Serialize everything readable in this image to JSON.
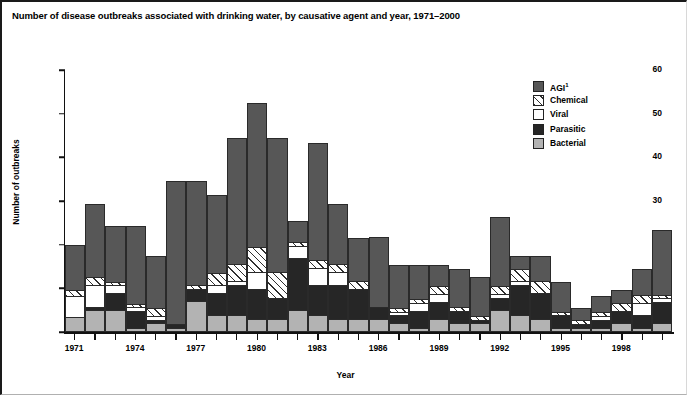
{
  "title": "Number of disease outbreaks associated with drinking water, by causative agent and year, 1971–2000",
  "axes": {
    "ylabel": "Number of outbreaks",
    "xlabel": "Year",
    "yticks": [
      "0",
      "10",
      "20",
      "30",
      "40",
      "50",
      "60"
    ],
    "xticklabels": [
      "1971",
      "1974",
      "1977",
      "1980",
      "1983",
      "1986",
      "1989",
      "1992",
      "1995",
      "1998"
    ]
  },
  "legend": {
    "title": "",
    "items": [
      {
        "label": "AGI",
        "sup": "1",
        "key": "agi",
        "color": "#575757",
        "swatch": "s-agi"
      },
      {
        "label": "Chemical",
        "sup": "",
        "key": "chemical",
        "color": "#ffffff",
        "swatch": "s-chem"
      },
      {
        "label": "Viral",
        "sup": "",
        "key": "viral",
        "color": "#ffffff",
        "swatch": "s-viral"
      },
      {
        "label": "Parasitic",
        "sup": "",
        "key": "parasitic",
        "color": "#262626",
        "swatch": "s-para"
      },
      {
        "label": "Bacterial",
        "sup": "",
        "key": "bacterial",
        "color": "#b3b3b3",
        "swatch": "s-bact"
      }
    ]
  },
  "chart_data": {
    "type": "bar",
    "stacked": true,
    "title": "Number of disease outbreaks associated with drinking water, by causative agent and year, 1971–2000",
    "xlabel": "Year",
    "ylabel": "Number of outbreaks",
    "ylim": [
      0,
      60
    ],
    "ytick_step": 10,
    "grid": false,
    "legend_position": "upper right",
    "stack_order_bottom_to_top": [
      "Bacterial",
      "Parasitic",
      "Viral",
      "Chemical",
      "AGI"
    ],
    "categories": [
      1971,
      1972,
      1973,
      1974,
      1975,
      1976,
      1977,
      1978,
      1979,
      1980,
      1981,
      1982,
      1983,
      1984,
      1985,
      1986,
      1987,
      1988,
      1989,
      1990,
      1991,
      1992,
      1993,
      1994,
      1995,
      1996,
      1997,
      1998,
      1999,
      2000
    ],
    "series": [
      {
        "name": "Bacterial",
        "values": [
          3.5,
          5,
          5,
          1,
          2,
          1,
          7,
          4,
          4,
          3,
          3,
          5,
          4,
          3,
          3,
          3,
          2,
          1,
          3,
          2,
          2,
          5,
          4,
          3,
          1,
          1,
          1,
          2,
          1,
          2
        ]
      },
      {
        "name": "Parasitic",
        "values": [
          0,
          1,
          4,
          4,
          1,
          1,
          3,
          5,
          7,
          7,
          5,
          12,
          7,
          8,
          7,
          3,
          2,
          4,
          4,
          3,
          1,
          3,
          7,
          6,
          3,
          1,
          2,
          3,
          3,
          5
        ]
      },
      {
        "name": "Viral",
        "values": [
          5,
          5,
          2,
          1,
          1,
          0,
          0,
          2,
          1,
          4,
          0,
          3,
          4,
          3,
          0,
          0,
          1,
          2,
          2,
          0,
          0,
          1,
          1,
          0,
          0,
          0,
          1,
          0,
          3,
          1
        ]
      },
      {
        "name": "Chemical",
        "values": [
          1.5,
          2,
          1,
          1,
          2,
          0,
          1,
          3,
          4,
          6,
          6,
          1,
          2,
          2,
          2,
          0,
          1,
          1,
          2,
          1,
          1,
          2,
          3,
          3,
          1,
          1,
          1,
          2,
          2,
          1
        ]
      },
      {
        "name": "AGI",
        "values": [
          10.5,
          17,
          13,
          18,
          12,
          33,
          24,
          18,
          29,
          33,
          31,
          5,
          27,
          14,
          10,
          16,
          10,
          8,
          5,
          9,
          9,
          16,
          3,
          6,
          7,
          3,
          4,
          3,
          6,
          15
        ]
      }
    ],
    "totals": [
      20.5,
      30,
      25,
      25,
      18,
      35,
      35,
      32,
      45,
      53,
      45,
      26,
      44,
      30,
      22,
      22,
      16,
      16,
      16,
      15,
      13,
      27,
      18,
      18,
      12,
      6,
      9,
      10,
      15,
      24
    ]
  }
}
